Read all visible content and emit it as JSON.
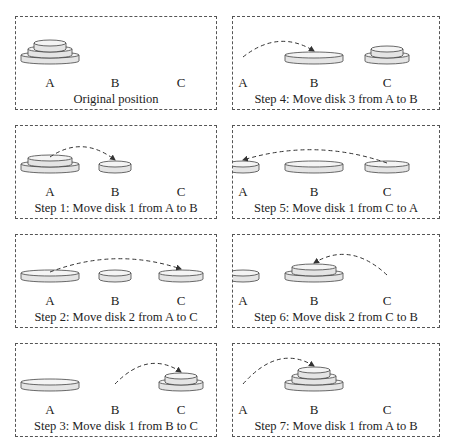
{
  "diagram": {
    "pegs": [
      "A",
      "B",
      "C"
    ],
    "colors": {
      "disk_fill": "#e4e4e4",
      "disk_top": "#f4f4f4",
      "disk_stroke": "#444444",
      "border": "#555555",
      "arrow": "#333333"
    },
    "panels": [
      {
        "id": "p0",
        "caption": "Original position",
        "state": {
          "A": [
            3,
            2,
            1
          ],
          "B": [],
          "C": []
        },
        "arrow": null
      },
      {
        "id": "p1",
        "caption": "Step 1: Move disk 1 from A to B",
        "state": {
          "A": [
            3,
            2
          ],
          "B": [
            1
          ],
          "C": []
        },
        "arrow": {
          "from": "A",
          "to": "B"
        }
      },
      {
        "id": "p2",
        "caption": "Step 2: Move disk 2 from A to C",
        "state": {
          "A": [
            3
          ],
          "B": [
            1
          ],
          "C": [
            2
          ]
        },
        "arrow": {
          "from": "A",
          "to": "C"
        }
      },
      {
        "id": "p3",
        "caption": "Step 3: Move disk 1 from B to C",
        "state": {
          "A": [
            3
          ],
          "B": [],
          "C": [
            2,
            1
          ]
        },
        "arrow": {
          "from": "B",
          "to": "C"
        }
      },
      {
        "id": "p4",
        "caption": "Step 4: Move disk 3 from A to B",
        "state": {
          "A": [],
          "B": [
            3
          ],
          "C": [
            2,
            1
          ]
        },
        "arrow": {
          "from": "A",
          "to": "B"
        }
      },
      {
        "id": "p5",
        "caption": "Step 5: Move disk 1 from C to A",
        "state": {
          "A": [
            1
          ],
          "B": [
            3
          ],
          "C": [
            2
          ]
        },
        "arrow": {
          "from": "C",
          "to": "A"
        }
      },
      {
        "id": "p6",
        "caption": "Step 6: Move disk 2 from C to B",
        "state": {
          "A": [
            1
          ],
          "B": [
            3,
            2
          ],
          "C": []
        },
        "arrow": {
          "from": "C",
          "to": "B"
        }
      },
      {
        "id": "p7",
        "caption": "Step 7: Move disk 1 from A to B",
        "state": {
          "A": [],
          "B": [
            3,
            2,
            1
          ],
          "C": []
        },
        "arrow": {
          "from": "A",
          "to": "B"
        }
      }
    ]
  }
}
